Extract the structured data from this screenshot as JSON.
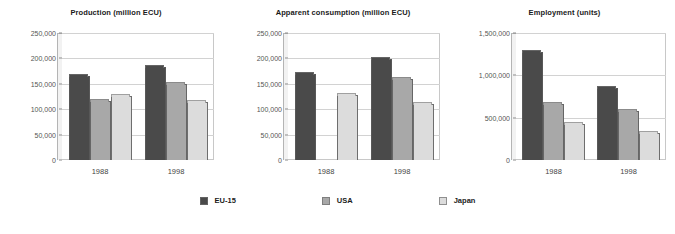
{
  "chart_data": [
    {
      "type": "bar",
      "title": "Production (million ECU)",
      "xlabel": "",
      "ylabel": "",
      "categories": [
        "1988",
        "1998"
      ],
      "series": [
        {
          "name": "EU-15",
          "color": "#4a4a4a",
          "values": [
            165000,
            183000
          ]
        },
        {
          "name": "USA",
          "color": "#a8a8a8",
          "values": [
            117000,
            150000
          ]
        },
        {
          "name": "Japan",
          "color": "#dcdcdc",
          "values": [
            126000,
            115000
          ]
        }
      ],
      "ylim": [
        0,
        250000
      ],
      "yticks": [
        0,
        50000,
        100000,
        150000,
        200000,
        250000
      ],
      "yticklabels": [
        "0",
        "50,000",
        "100,000",
        "150,000",
        "200,000",
        "250,000"
      ],
      "grid": true,
      "legend": "bottom"
    },
    {
      "type": "bar",
      "title": "Apparent consumption (million ECU)",
      "xlabel": "",
      "ylabel": "",
      "categories": [
        "1988",
        "1998"
      ],
      "series": [
        {
          "name": "EU-15",
          "color": "#4a4a4a",
          "values": [
            170000,
            198000
          ]
        },
        {
          "name": "USA",
          "color": "#a8a8a8",
          "values": [
            0,
            160000
          ]
        },
        {
          "name": "Japan",
          "color": "#dcdcdc",
          "values": [
            128000,
            110000
          ]
        }
      ],
      "ylim": [
        0,
        250000
      ],
      "yticks": [
        0,
        50000,
        100000,
        150000,
        200000,
        250000
      ],
      "yticklabels": [
        "0",
        "50,000",
        "100,000",
        "150,000",
        "200,000",
        "250,000"
      ],
      "grid": true,
      "legend": "bottom"
    },
    {
      "type": "bar",
      "title": "Employment (units)",
      "xlabel": "",
      "ylabel": "",
      "categories": [
        "1988",
        "1998"
      ],
      "series": [
        {
          "name": "EU-15",
          "color": "#4a4a4a",
          "values": [
            1280000,
            850000
          ]
        },
        {
          "name": "USA",
          "color": "#a8a8a8",
          "values": [
            660000,
            580000
          ]
        },
        {
          "name": "Japan",
          "color": "#dcdcdc",
          "values": [
            420000,
            320000
          ]
        }
      ],
      "ylim": [
        0,
        1500000
      ],
      "yticks": [
        0,
        500000,
        1000000,
        1500000
      ],
      "yticklabels": [
        "0",
        "500,000",
        "1,000,000",
        "1,500,000"
      ],
      "grid": true,
      "legend": "bottom"
    }
  ],
  "legend": {
    "items": [
      {
        "label": "EU-15",
        "color": "#4a4a4a"
      },
      {
        "label": "USA",
        "color": "#a8a8a8"
      },
      {
        "label": "Japan",
        "color": "#dcdcdc"
      }
    ]
  }
}
